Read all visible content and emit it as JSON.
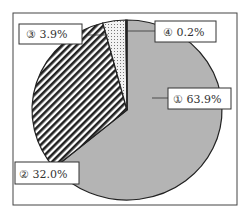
{
  "chart_data": {
    "type": "pie",
    "title": "",
    "start_angle_deg": 0,
    "direction": "clockwise",
    "slices": [
      {
        "id": "1",
        "label": "① 63.9%",
        "value": 63.9,
        "fill": "#b4b4b4",
        "pattern": "solid-grey"
      },
      {
        "id": "2",
        "label": "② 32.0%",
        "value": 32.0,
        "fill": "#ffffff",
        "pattern": "diagonal-stripes"
      },
      {
        "id": "3",
        "label": "③ 3.9%",
        "value": 3.9,
        "fill": "#e6e6e6",
        "pattern": "dots"
      },
      {
        "id": "4",
        "label": "④ 0.2%",
        "value": 0.2,
        "fill": "#ffffff",
        "pattern": "white"
      }
    ],
    "legend": "none (callout labels)",
    "grid": false
  },
  "labels": {
    "s1": "① 63.9%",
    "s2": "② 32.0%",
    "s3": "③ 3.9%",
    "s4": "④ 0.2%"
  }
}
